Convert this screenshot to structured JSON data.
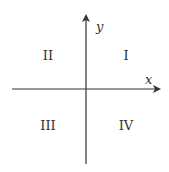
{
  "diagram": {
    "axes": {
      "x_label": "x",
      "y_label": "y"
    },
    "quadrants": [
      {
        "id": "I",
        "label": "I"
      },
      {
        "id": "II",
        "label": "II"
      },
      {
        "id": "III",
        "label": "III"
      },
      {
        "id": "IV",
        "label": "IV"
      }
    ],
    "colors": {
      "line": "#333333",
      "background": "#ffffff"
    }
  }
}
